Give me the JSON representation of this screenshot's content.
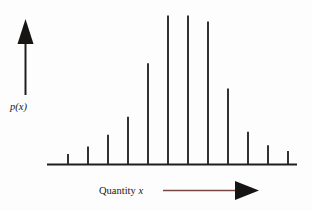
{
  "figure": {
    "background_color": "#fdfdfd",
    "width": 312,
    "height": 211,
    "y_axis_label_prefix": "p(",
    "y_axis_label_var": "x",
    "y_axis_label_suffix": ")",
    "x_axis_label_prefix": "Quantity ",
    "x_axis_label_var": "x",
    "x_axis_arrow_color": "#7a4845",
    "arrow_head_color": "#171414",
    "axis_color": "#201d1d",
    "bar_color": "#2a2626"
  },
  "chart_data": {
    "type": "bar",
    "title": "",
    "subtitle": "",
    "xlabel": "Quantity x",
    "ylabel": "p(x)",
    "categories": [
      "1",
      "2",
      "3",
      "4",
      "5",
      "6",
      "7",
      "8",
      "9",
      "10",
      "11",
      "12"
    ],
    "values": [
      0.07,
      0.12,
      0.2,
      0.32,
      0.68,
      1.0,
      1.0,
      0.96,
      0.51,
      0.22,
      0.13,
      0.09
    ],
    "ylim": [
      0,
      1.05
    ],
    "xlim": [
      0,
      13
    ],
    "grid": false,
    "legend": null,
    "axis_ticks_visible": false,
    "tick_labels_visible": false,
    "annotations": [
      {
        "text": "p(x)",
        "position": "y-axis-label",
        "style": "italic-serif"
      },
      {
        "text": "Quantity x",
        "position": "x-axis-label",
        "style": "serif-with-italic-variable"
      }
    ]
  }
}
